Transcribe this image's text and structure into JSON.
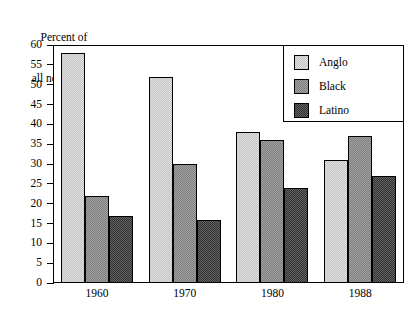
{
  "chart_data": {
    "type": "bar",
    "title": "",
    "ylabel_line1": "Percent of",
    "ylabel_line2": "all new felons",
    "xlabel": "",
    "categories": [
      "1960",
      "1970",
      "1980",
      "1988"
    ],
    "series": [
      {
        "name": "Anglo",
        "color": "#d2d2d2",
        "values": [
          58,
          52,
          38,
          31
        ]
      },
      {
        "name": "Black",
        "color": "#8f8f8f",
        "values": [
          22,
          30,
          36,
          37
        ]
      },
      {
        "name": "Latino",
        "color": "#4a4a4a",
        "values": [
          17,
          16,
          24,
          27
        ]
      }
    ],
    "ylim": [
      0,
      60
    ],
    "ytick_step": 5,
    "yticks": [
      0,
      5,
      10,
      15,
      20,
      25,
      30,
      35,
      40,
      45,
      50,
      55,
      60
    ],
    "ytick_labels": [
      "0",
      "5",
      "10",
      "15",
      "20",
      "25",
      "30",
      "35",
      "40",
      "45",
      "50",
      "55",
      "60"
    ],
    "grid": false,
    "legend_position": "top-right",
    "legend_entries": [
      "Anglo",
      "Black",
      "Latino"
    ]
  }
}
